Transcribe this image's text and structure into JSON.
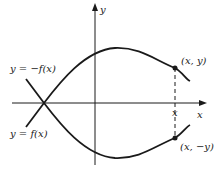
{
  "figure": {
    "axes": {
      "x_label": "x",
      "y_label": "y"
    },
    "curves": [
      {
        "name": "reflected",
        "label": "y = −f(x)"
      },
      {
        "name": "original",
        "label": "y = f(x)"
      }
    ],
    "points": [
      {
        "name": "upper-point",
        "label": "(x, y)"
      },
      {
        "name": "lower-point",
        "label": "(x, −y)"
      }
    ],
    "x_tick_label": "x",
    "colors": {
      "ink": "#1a1a1a",
      "background": "#ffffff"
    }
  }
}
